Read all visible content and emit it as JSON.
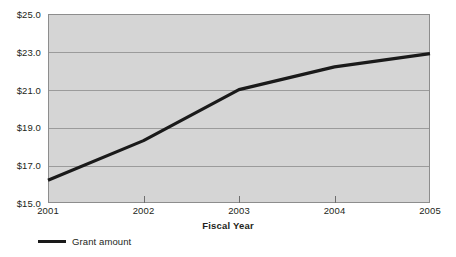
{
  "chart_data": {
    "type": "line",
    "title": "",
    "xlabel": "Fiscal Year",
    "ylabel": "",
    "categories": [
      "2001",
      "2002",
      "2003",
      "2004",
      "2005"
    ],
    "series": [
      {
        "name": "Grant amount",
        "values": [
          16.2,
          18.3,
          21.0,
          22.2,
          22.9
        ],
        "color": "#1a1a1a"
      }
    ],
    "ylim": [
      15.0,
      25.0
    ],
    "ytick_values": [
      15.0,
      17.0,
      19.0,
      21.0,
      23.0,
      25.0
    ],
    "ytick_labels": [
      "$15.0",
      "$17.0",
      "$19.0",
      "$21.0",
      "$23.0",
      "$25.0"
    ],
    "xtick_labels": [
      "2001",
      "2002",
      "2003",
      "2004",
      "2005"
    ],
    "grid": true,
    "grid_axis": "y",
    "legend_position": "bottom-left",
    "plot_background": "#d5d5d5",
    "plot_border_color": "#8d8d8d",
    "gridline_color": "#9b9b9b",
    "text_color": "#231f20"
  },
  "axis": {
    "x_title": "Fiscal Year"
  },
  "legend": {
    "entries": [
      {
        "label": "Grant amount",
        "color": "#1a1a1a"
      }
    ]
  }
}
